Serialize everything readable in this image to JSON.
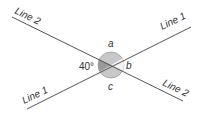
{
  "diagram": {
    "lines": [
      {
        "id": "line1",
        "label_start": "Line 1",
        "label_end": "Line 1"
      },
      {
        "id": "line2",
        "label_start": "Line 2",
        "label_end": "Line 2"
      }
    ],
    "angles": {
      "left": {
        "label": "40°",
        "value_deg": 40
      },
      "top": {
        "label": "a"
      },
      "right": {
        "label": "b"
      },
      "bottom": {
        "label": "c"
      }
    },
    "colors": {
      "line": "#555555",
      "circle_fill": "#c8c8c8",
      "shaded_angle": "#9a9a9a",
      "text": "#333333"
    }
  }
}
